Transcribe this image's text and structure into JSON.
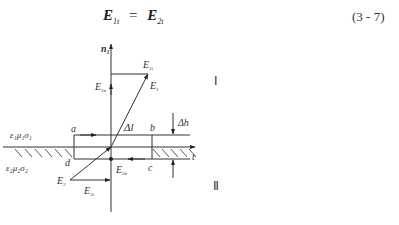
{
  "equation": {
    "lhs_symbol": "E",
    "lhs_sub": "1t",
    "operator": "=",
    "rhs_symbol": "E",
    "rhs_sub": "2t",
    "number": "(3 - 7)"
  },
  "figure": {
    "normal_vector_label": "n",
    "normal_vector_sub": "1",
    "E1t_label": "E",
    "E1t_sub": "1t",
    "E1_label": "E",
    "E1_sub": "1",
    "E1n_label": "E",
    "E1n_sub": "1n",
    "E2_label": "E",
    "E2_sub": "2",
    "E2n_label": "E",
    "E2n_sub": "2n",
    "E2t_label": "E",
    "E2t_sub": "2t",
    "region1_label": "Ⅰ",
    "region2_label": "Ⅱ",
    "medium1_label": "ε₁μ₁σ₁",
    "medium2_label": "ε₂μ₂σ₂",
    "corner_a": "a",
    "corner_b": "b",
    "corner_c": "c",
    "corner_d": "d",
    "delta_l_label": "Δl",
    "delta_h_label": "Δh",
    "tangent_axis_label": "t"
  }
}
